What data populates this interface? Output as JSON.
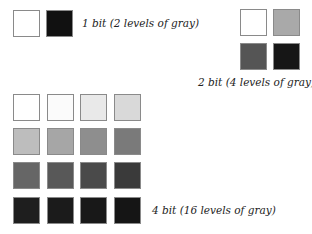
{
  "groups": {
    "one_bit": {
      "label": "1 bit (2 levels of gray)",
      "swatches": [
        "#ffffff",
        "#111111"
      ]
    },
    "two_bit": {
      "label": "2 bit (4 levels of gray)",
      "swatches": [
        "#ffffff",
        "#a9a9a9",
        "#555555",
        "#161616"
      ]
    },
    "four_bit": {
      "label": "4 bit (16 levels of gray)",
      "swatches": [
        "#ffffff",
        "#fbfbfb",
        "#e9e9e9",
        "#d9d9d9",
        "#bdbdbd",
        "#a6a6a6",
        "#8e8e8e",
        "#7a7a7a",
        "#666666",
        "#585858",
        "#4a4a4a",
        "#3a3a3a",
        "#1e1e1e",
        "#1b1b1b",
        "#181818",
        "#151515"
      ]
    }
  }
}
